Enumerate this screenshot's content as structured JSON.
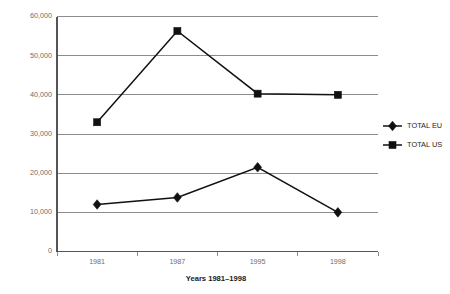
{
  "chart_data": {
    "type": "line",
    "title": "",
    "xlabel": "Years 1981–1998",
    "ylabel": "",
    "categories": [
      "1981",
      "1987",
      "1995",
      "1998"
    ],
    "ylim": [
      0,
      60000
    ],
    "yticks": [
      "0",
      "10,000",
      "20,000",
      "30,000",
      "40,000",
      "50,000",
      "60,000"
    ],
    "ytick_values": [
      0,
      10000,
      20000,
      30000,
      40000,
      50000,
      60000
    ],
    "grid": "horizontal",
    "legend_position": "right",
    "series": [
      {
        "name": "TOTAL EU",
        "marker": "diamond",
        "values": [
          12000,
          13800,
          21500,
          10000
        ]
      },
      {
        "name": "TOTAL US",
        "marker": "square",
        "values": [
          33000,
          56300,
          40300,
          40000
        ]
      }
    ]
  },
  "legend": {
    "items": [
      {
        "label": "TOTAL EU",
        "marker": "diamond-marker-icon"
      },
      {
        "label": "TOTAL US",
        "marker": "square-marker-icon"
      }
    ]
  },
  "colors": {
    "series": "#111111",
    "gridline": "#808080",
    "axis": "#555555",
    "tick_text": "#6e6e6e",
    "title_text": "#1a1a1a",
    "background": "#ffffff"
  }
}
